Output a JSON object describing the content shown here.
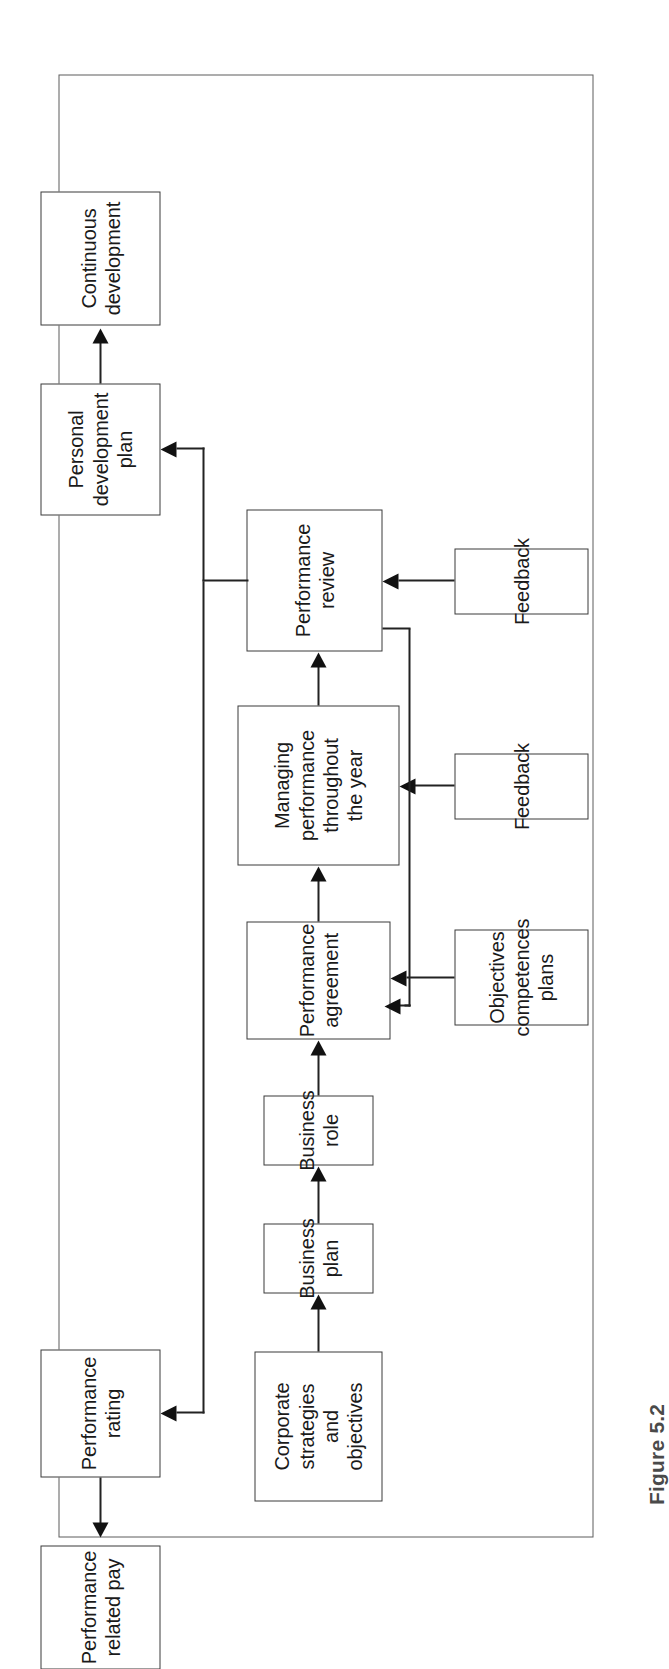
{
  "figure": {
    "caption": "Figure 5.2",
    "rotation_degrees": -90,
    "frame_color": "#5d5d5d",
    "node_border_color": "#3a3a3a",
    "connector_color": "#222222",
    "background_color": "#ffffff"
  },
  "diagram": {
    "type": "flowchart",
    "title": "",
    "orientation": "left-to-right performance management cycle",
    "nodes": [
      {
        "id": "corporate-strategies",
        "label": "Corporate\nstrategies\nand\nobjectives"
      },
      {
        "id": "business-plan",
        "label": "Business\nplan"
      },
      {
        "id": "business-role",
        "label": "Business\nrole"
      },
      {
        "id": "performance-agreement",
        "label": "Performance\nagreement"
      },
      {
        "id": "objectives-competences-plans",
        "label": "Objectives\ncompetences\nplans"
      },
      {
        "id": "managing-performance",
        "label": "Managing\nperformance\nthroughout\nthe year"
      },
      {
        "id": "feedback-managing",
        "label": "Feedback"
      },
      {
        "id": "performance-review",
        "label": "Performance\nreview"
      },
      {
        "id": "feedback-review",
        "label": "Feedback"
      },
      {
        "id": "performance-rating",
        "label": "Performance\nrating"
      },
      {
        "id": "performance-related-pay",
        "label": "Performance\nrelated pay"
      },
      {
        "id": "personal-development-plan",
        "label": "Personal\ndevelopment\nplan"
      },
      {
        "id": "continuous-development",
        "label": "Continuous\ndevelopment"
      }
    ],
    "edges": [
      {
        "from": "corporate-strategies",
        "to": "business-plan"
      },
      {
        "from": "business-plan",
        "to": "business-role"
      },
      {
        "from": "business-role",
        "to": "performance-agreement"
      },
      {
        "from": "objectives-competences-plans",
        "to": "performance-agreement"
      },
      {
        "from": "performance-agreement",
        "to": "managing-performance"
      },
      {
        "from": "feedback-managing",
        "to": "managing-performance"
      },
      {
        "from": "managing-performance",
        "to": "performance-review"
      },
      {
        "from": "feedback-review",
        "to": "performance-review"
      },
      {
        "from": "performance-review",
        "to": "performance-rating"
      },
      {
        "from": "performance-rating",
        "to": "performance-related-pay"
      },
      {
        "from": "performance-review",
        "to": "personal-development-plan"
      },
      {
        "from": "personal-development-plan",
        "to": "continuous-development"
      },
      {
        "from": "performance-review",
        "to": "performance-agreement",
        "kind": "feedback-loop"
      }
    ]
  }
}
